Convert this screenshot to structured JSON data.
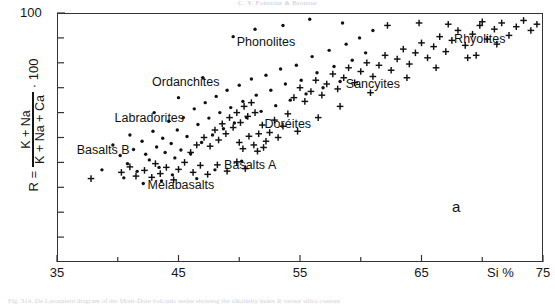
{
  "page": {
    "header_text": "C. Y. Fontaine & Brousse",
    "caption_text": "Fig. 314. De Larouziere diagram of the Mont-Dore volcanic series showing the alkalinity index R versus silica content"
  },
  "figure": {
    "panel_label": "a"
  },
  "axes": {
    "x_label": "Si %",
    "x_ticks": [
      {
        "value": 35,
        "label": "35"
      },
      {
        "value": 40,
        "label": ""
      },
      {
        "value": 45,
        "label": "45"
      },
      {
        "value": 50,
        "label": ""
      },
      {
        "value": 55,
        "label": "55"
      },
      {
        "value": 60,
        "label": ""
      },
      {
        "value": 65,
        "label": "65"
      },
      {
        "value": 70,
        "label": ""
      },
      {
        "value": 75,
        "label": "75"
      }
    ],
    "y_top_label": "100",
    "y_title": {
      "r_equals": "R =",
      "numerator": "K + Na",
      "denominator": "K + Na + Ca",
      "multiplier": "· 100"
    }
  },
  "chart_data": {
    "type": "scatter",
    "title": "",
    "xlabel": "Si %",
    "ylabel": "R = (K + Na)/(K + Na + Ca) · 100",
    "xlim": [
      35,
      75
    ],
    "ylim": [
      0,
      100
    ],
    "grid": false,
    "legend": "none",
    "marker_types": {
      "dot": "small filled circle",
      "plus": "plus sign"
    },
    "annotations": [
      {
        "text": "Phonolites",
        "x": 52.2,
        "y": 88.0
      },
      {
        "text": "Ordanchites",
        "x": 45.6,
        "y": 72.0
      },
      {
        "text": "Labradorites",
        "x": 42.6,
        "y": 57.5
      },
      {
        "text": "Basalts B",
        "x": 38.8,
        "y": 44.5
      },
      {
        "text": "Melabasalts",
        "x": 45.2,
        "y": 30.5
      },
      {
        "text": "Basalts A",
        "x": 50.9,
        "y": 38.5
      },
      {
        "text": "Doréites",
        "x": 54.0,
        "y": 55.0
      },
      {
        "text": "Sancyites",
        "x": 61.0,
        "y": 71.0
      },
      {
        "text": "Rhyolites",
        "x": 69.8,
        "y": 89.0
      }
    ],
    "series": [
      {
        "name": "dots",
        "marker": "dot",
        "points": [
          [
            38.7,
            37.0
          ],
          [
            40.2,
            42.8
          ],
          [
            40.8,
            39.5
          ],
          [
            41.3,
            45.2
          ],
          [
            41.6,
            36.4
          ],
          [
            42.0,
            48.5
          ],
          [
            42.3,
            43.3
          ],
          [
            42.6,
            41.0
          ],
          [
            42.9,
            52.5
          ],
          [
            43.2,
            46.2
          ],
          [
            43.4,
            38.0
          ],
          [
            43.7,
            49.7
          ],
          [
            43.9,
            44.0
          ],
          [
            44.2,
            56.5
          ],
          [
            44.4,
            47.6
          ],
          [
            44.7,
            41.8
          ],
          [
            44.9,
            53.0
          ],
          [
            45.2,
            45.0
          ],
          [
            45.4,
            58.0
          ],
          [
            45.7,
            50.4
          ],
          [
            46.0,
            43.5
          ],
          [
            46.3,
            61.5
          ],
          [
            46.6,
            55.2
          ],
          [
            46.9,
            48.0
          ],
          [
            47.2,
            64.0
          ],
          [
            47.5,
            57.8
          ],
          [
            47.8,
            51.0
          ],
          [
            48.1,
            66.5
          ],
          [
            48.4,
            60.0
          ],
          [
            48.7,
            53.5
          ],
          [
            49.0,
            69.0
          ],
          [
            49.3,
            62.0
          ],
          [
            49.6,
            55.8
          ],
          [
            50.0,
            71.0
          ],
          [
            50.3,
            64.5
          ],
          [
            50.6,
            58.0
          ],
          [
            51.0,
            73.5
          ],
          [
            51.4,
            67.0
          ],
          [
            51.8,
            60.5
          ],
          [
            52.2,
            75.0
          ],
          [
            52.6,
            69.0
          ],
          [
            53.0,
            62.8
          ],
          [
            53.4,
            77.5
          ],
          [
            53.8,
            71.5
          ],
          [
            54.2,
            65.0
          ],
          [
            54.7,
            79.0
          ],
          [
            55.1,
            73.0
          ],
          [
            55.5,
            67.5
          ],
          [
            56.0,
            82.5
          ],
          [
            56.4,
            76.0
          ],
          [
            56.9,
            70.0
          ],
          [
            57.4,
            85.0
          ],
          [
            57.8,
            78.5
          ],
          [
            58.3,
            72.5
          ],
          [
            58.8,
            87.5
          ],
          [
            59.3,
            81.0
          ],
          [
            59.9,
            90.0
          ],
          [
            60.4,
            84.0
          ],
          [
            61.0,
            93.0
          ],
          [
            55.8,
            97.5
          ],
          [
            58.5,
            96.0
          ],
          [
            51.3,
            93.5
          ],
          [
            53.6,
            95.0
          ],
          [
            49.5,
            90.5
          ],
          [
            47.0,
            74.0
          ],
          [
            45.0,
            66.0
          ],
          [
            43.0,
            60.0
          ],
          [
            41.0,
            51.0
          ],
          [
            44.5,
            35.0
          ],
          [
            46.5,
            33.5
          ],
          [
            48.0,
            37.0
          ],
          [
            50.2,
            40.5
          ],
          [
            39.6,
            47.0
          ],
          [
            40.5,
            33.8
          ],
          [
            42.1,
            31.5
          ],
          [
            43.6,
            32.6
          ]
        ]
      },
      {
        "name": "plus",
        "marker": "plus",
        "points": [
          [
            40.3,
            36.0
          ],
          [
            41.0,
            38.2
          ],
          [
            41.5,
            34.5
          ],
          [
            42.2,
            36.8
          ],
          [
            42.8,
            34.0
          ],
          [
            43.1,
            39.5
          ],
          [
            43.5,
            35.5
          ],
          [
            44.0,
            38.0
          ],
          [
            44.6,
            33.0
          ],
          [
            45.0,
            37.2
          ],
          [
            45.5,
            40.0
          ],
          [
            46.2,
            36.0
          ],
          [
            46.8,
            38.8
          ],
          [
            47.4,
            35.2
          ],
          [
            48.2,
            39.0
          ],
          [
            49.0,
            36.5
          ],
          [
            49.8,
            40.2
          ],
          [
            50.5,
            37.5
          ],
          [
            46.0,
            44.0
          ],
          [
            46.5,
            47.0
          ],
          [
            47.1,
            50.0
          ],
          [
            47.6,
            46.5
          ],
          [
            48.0,
            53.0
          ],
          [
            48.3,
            49.0
          ],
          [
            48.6,
            55.5
          ],
          [
            48.9,
            51.5
          ],
          [
            49.2,
            58.0
          ],
          [
            49.5,
            54.0
          ],
          [
            49.8,
            60.0
          ],
          [
            50.1,
            56.0
          ],
          [
            50.4,
            62.5
          ],
          [
            50.7,
            58.5
          ],
          [
            51.0,
            64.0
          ],
          [
            51.3,
            60.0
          ],
          [
            51.6,
            51.5
          ],
          [
            51.9,
            55.0
          ],
          [
            52.2,
            48.5
          ],
          [
            52.5,
            52.0
          ],
          [
            52.9,
            57.0
          ],
          [
            53.2,
            50.0
          ],
          [
            53.6,
            54.5
          ],
          [
            54.0,
            59.5
          ],
          [
            50.0,
            48.0
          ],
          [
            50.3,
            45.5
          ],
          [
            50.8,
            50.5
          ],
          [
            51.2,
            47.0
          ],
          [
            51.5,
            44.5
          ],
          [
            52.0,
            46.0
          ],
          [
            54.5,
            66.0
          ],
          [
            55.0,
            70.0
          ],
          [
            55.4,
            64.5
          ],
          [
            55.9,
            68.5
          ],
          [
            56.3,
            73.0
          ],
          [
            56.8,
            67.0
          ],
          [
            57.2,
            71.5
          ],
          [
            57.7,
            75.5
          ],
          [
            58.1,
            69.5
          ],
          [
            58.6,
            74.0
          ],
          [
            59.0,
            78.0
          ],
          [
            59.5,
            72.0
          ],
          [
            60.0,
            76.5
          ],
          [
            60.5,
            80.0
          ],
          [
            61.0,
            74.5
          ],
          [
            61.5,
            79.0
          ],
          [
            62.0,
            83.0
          ],
          [
            62.5,
            77.0
          ],
          [
            63.0,
            81.5
          ],
          [
            63.5,
            85.5
          ],
          [
            64.0,
            79.5
          ],
          [
            64.5,
            84.0
          ],
          [
            65.0,
            88.0
          ],
          [
            65.5,
            82.0
          ],
          [
            66.0,
            86.5
          ],
          [
            66.5,
            90.5
          ],
          [
            67.0,
            84.5
          ],
          [
            67.5,
            89.0
          ],
          [
            68.0,
            93.0
          ],
          [
            68.6,
            87.0
          ],
          [
            69.2,
            91.5
          ],
          [
            69.8,
            95.0
          ],
          [
            70.4,
            89.5
          ],
          [
            71.0,
            93.5
          ],
          [
            71.6,
            96.0
          ],
          [
            72.2,
            91.0
          ],
          [
            72.8,
            94.5
          ],
          [
            73.4,
            97.0
          ],
          [
            74.0,
            93.0
          ],
          [
            74.5,
            95.5
          ],
          [
            62.2,
            95.0
          ],
          [
            64.8,
            96.0
          ],
          [
            67.2,
            95.5
          ],
          [
            70.0,
            96.5
          ],
          [
            71.2,
            87.5
          ],
          [
            68.8,
            82.0
          ],
          [
            66.2,
            78.0
          ],
          [
            63.8,
            74.0
          ],
          [
            60.8,
            68.0
          ],
          [
            58.3,
            62.5
          ],
          [
            56.5,
            58.0
          ],
          [
            54.8,
            52.5
          ],
          [
            37.8,
            33.5
          ],
          [
            69.5,
            83.0
          ]
        ]
      }
    ]
  }
}
